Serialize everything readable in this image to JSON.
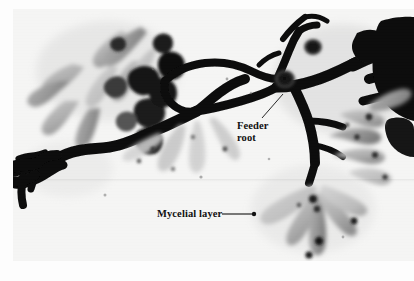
{
  "figure": {
    "kind": "scientific-photograph",
    "medium": "black-and-white photographic plate",
    "width": 414,
    "height": 281
  },
  "plate": {
    "background_color": "#f6f6f5",
    "ink_color": "#0a0a0a",
    "mid_tone_color": "#8d8d8d",
    "light_tone_color": "#cfcfcf",
    "margin_left": 13,
    "margin_top": 9
  },
  "annotations": [
    {
      "id": "feeder-root",
      "lines": [
        "Feeder",
        "root"
      ],
      "text": "Feeder\nroot",
      "label_x": 237,
      "label_y": 120,
      "font_size_px": 10.5,
      "weight": "bold",
      "color": "#111111",
      "leader": {
        "type": "diagonal-line",
        "from_x": 262,
        "from_y": 118,
        "to_x": 283,
        "to_y": 94,
        "terminus": "none",
        "stroke_width": 0.9
      }
    },
    {
      "id": "mycelial-layer",
      "lines": [
        "Mycelial layer"
      ],
      "text": "Mycelial layer",
      "label_x": 157,
      "label_y": 208,
      "font_size_px": 10.5,
      "weight": "bold",
      "color": "#111111",
      "leader": {
        "type": "horizontal-line-with-dot",
        "from_x": 222,
        "from_y": 214,
        "to_x": 254,
        "to_y": 214,
        "terminus": "filled-dot",
        "dot_radius": 2.2,
        "stroke_width": 1.0
      }
    }
  ],
  "specimen": {
    "main_axis_description": "dark branching feeder root running left-to-right across the plate",
    "clusters": [
      {
        "name": "upper-left-mycorrhizal-cluster",
        "x": 78,
        "y": 70,
        "tone": "light-gray-clubbed-tips"
      },
      {
        "name": "right-edge-root-mass",
        "x": 385,
        "y": 75,
        "tone": "dense-black"
      },
      {
        "name": "lower-center-mycorrhizal-cluster",
        "x": 300,
        "y": 205,
        "tone": "light-gray-clubbed-tips"
      },
      {
        "name": "right-mid-mycorrhizal-cluster",
        "x": 355,
        "y": 135,
        "tone": "mid-gray-clubbed-tips"
      },
      {
        "name": "lower-left-root-branch",
        "x": 45,
        "y": 165,
        "tone": "dense-black"
      }
    ]
  }
}
